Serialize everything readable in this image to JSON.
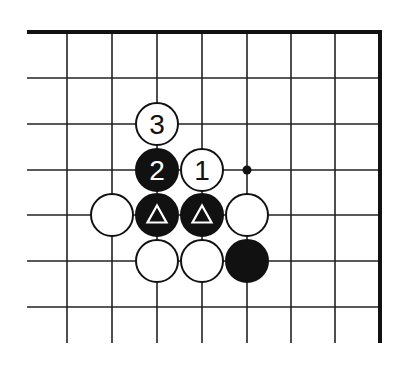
{
  "diagram": {
    "type": "go-board-fragment",
    "grid": {
      "x_lines": [
        27,
        67,
        112,
        157,
        202,
        247,
        291,
        335,
        380
      ],
      "y_lines": [
        32,
        78,
        124,
        170,
        215,
        261,
        307
      ],
      "bottom_extent": 343,
      "left_extent": 27,
      "top_edge_thick": true,
      "right_edge_thick": true
    },
    "stones": [
      {
        "color": "white",
        "col": 3,
        "row": 2,
        "label": "3"
      },
      {
        "color": "black",
        "col": 3,
        "row": 3,
        "label": "2"
      },
      {
        "color": "white",
        "col": 4,
        "row": 3,
        "label": "1"
      },
      {
        "color": "white",
        "col": 2,
        "row": 4,
        "label": ""
      },
      {
        "color": "black",
        "col": 3,
        "row": 4,
        "label": "△"
      },
      {
        "color": "black",
        "col": 4,
        "row": 4,
        "label": "△"
      },
      {
        "color": "white",
        "col": 5,
        "row": 4,
        "label": ""
      },
      {
        "color": "white",
        "col": 3,
        "row": 5,
        "label": ""
      },
      {
        "color": "white",
        "col": 4,
        "row": 5,
        "label": ""
      },
      {
        "color": "black",
        "col": 5,
        "row": 5,
        "label": ""
      }
    ],
    "markers": [
      {
        "type": "dot",
        "col": 5,
        "row": 3
      }
    ]
  }
}
